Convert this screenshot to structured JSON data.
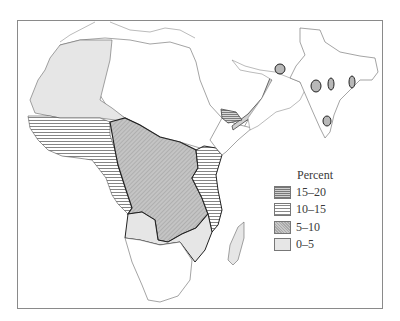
{
  "legend": {
    "title": "Percent",
    "items": [
      {
        "label": "15–20",
        "pattern": "dense-horizontal-hatch"
      },
      {
        "label": "10–15",
        "pattern": "horizontal-hatch"
      },
      {
        "label": "5–10",
        "pattern": "stipple-gray"
      },
      {
        "label": "0–5",
        "pattern": "light-gray"
      }
    ]
  },
  "colors": {
    "frame": "#8a8a8a",
    "light_fill": "#e6e6e6",
    "dot_fill": "#b8b8b8",
    "hatch": "#777777",
    "boundary": "#222222"
  }
}
